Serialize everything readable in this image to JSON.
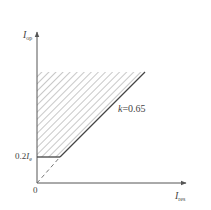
{
  "diagram": {
    "type": "operating-characteristic",
    "y_axis": {
      "symbol": "I",
      "subscript": "op"
    },
    "x_axis": {
      "symbol": "I",
      "subscript": "res"
    },
    "origin_label": "0",
    "threshold_label": {
      "prefix": "0.2",
      "symbol": "I",
      "subscript": "e"
    },
    "slope_label": {
      "symbol": "k",
      "value": "=0.65"
    },
    "region": "operating region (hatched)"
  },
  "colors": {
    "axis": "#555555",
    "line": "#444444",
    "hatch": "#9a9a9a",
    "text": "#444444"
  }
}
